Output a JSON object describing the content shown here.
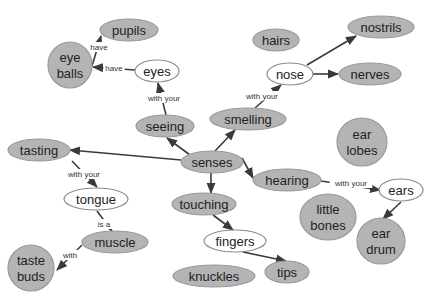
{
  "diagram": {
    "colors": {
      "concept_fill": "#b4b4b4",
      "focus_fill": "#ffffff",
      "edge": "#3a3a3a",
      "background": "#ffffff"
    },
    "nodes": [
      {
        "id": "pupils",
        "lines": [
          "pupils"
        ],
        "x": 129,
        "y": 30,
        "rx": 29,
        "ry": 11,
        "style": "gray"
      },
      {
        "id": "eye_balls",
        "lines": [
          "eye",
          "balls"
        ],
        "x": 70,
        "y": 65,
        "rx": 22,
        "ry": 23,
        "style": "gray"
      },
      {
        "id": "eyes",
        "lines": [
          "eyes"
        ],
        "x": 157,
        "y": 71,
        "rx": 22,
        "ry": 11,
        "style": "white"
      },
      {
        "id": "seeing",
        "lines": [
          "seeing"
        ],
        "x": 165,
        "y": 126,
        "rx": 29,
        "ry": 11,
        "style": "gray"
      },
      {
        "id": "smelling",
        "lines": [
          "smelling"
        ],
        "x": 248,
        "y": 119,
        "rx": 38,
        "ry": 11,
        "style": "gray"
      },
      {
        "id": "hairs",
        "lines": [
          "hairs"
        ],
        "x": 276,
        "y": 40,
        "rx": 23,
        "ry": 11,
        "style": "gray"
      },
      {
        "id": "nostrils",
        "lines": [
          "nostrils"
        ],
        "x": 381,
        "y": 27,
        "rx": 33,
        "ry": 11,
        "style": "gray"
      },
      {
        "id": "nose",
        "lines": [
          "nose"
        ],
        "x": 290,
        "y": 74,
        "rx": 23,
        "ry": 11,
        "style": "white"
      },
      {
        "id": "nerves",
        "lines": [
          "nerves"
        ],
        "x": 370,
        "y": 74,
        "rx": 31,
        "ry": 11,
        "style": "gray"
      },
      {
        "id": "ear_lobes",
        "lines": [
          "ear",
          "lobes"
        ],
        "x": 362,
        "y": 142,
        "rx": 25,
        "ry": 24,
        "style": "gray"
      },
      {
        "id": "tasting",
        "lines": [
          "tasting"
        ],
        "x": 39,
        "y": 150,
        "rx": 31,
        "ry": 11,
        "style": "gray"
      },
      {
        "id": "senses",
        "lines": [
          "senses"
        ],
        "x": 212,
        "y": 162,
        "rx": 31,
        "ry": 11,
        "style": "gray"
      },
      {
        "id": "hearing",
        "lines": [
          "hearing"
        ],
        "x": 287,
        "y": 180,
        "rx": 34,
        "ry": 11,
        "style": "gray"
      },
      {
        "id": "ears",
        "lines": [
          "ears"
        ],
        "x": 401,
        "y": 190,
        "rx": 22,
        "ry": 11,
        "style": "white"
      },
      {
        "id": "tongue",
        "lines": [
          "tongue"
        ],
        "x": 96,
        "y": 199,
        "rx": 32,
        "ry": 11,
        "style": "white"
      },
      {
        "id": "touching",
        "lines": [
          "touching"
        ],
        "x": 204,
        "y": 204,
        "rx": 32,
        "ry": 11,
        "style": "gray"
      },
      {
        "id": "little_bones",
        "lines": [
          "little",
          "bones"
        ],
        "x": 328,
        "y": 217,
        "rx": 28,
        "ry": 23,
        "style": "gray"
      },
      {
        "id": "ear_drum",
        "lines": [
          "ear",
          "drum"
        ],
        "x": 381,
        "y": 241,
        "rx": 24,
        "ry": 23,
        "style": "gray"
      },
      {
        "id": "muscle",
        "lines": [
          "muscle"
        ],
        "x": 115,
        "y": 242,
        "rx": 33,
        "ry": 11,
        "style": "gray"
      },
      {
        "id": "fingers",
        "lines": [
          "fingers"
        ],
        "x": 235,
        "y": 241,
        "rx": 31,
        "ry": 11,
        "style": "white"
      },
      {
        "id": "taste_buds",
        "lines": [
          "taste",
          "buds"
        ],
        "x": 31,
        "y": 268,
        "rx": 23,
        "ry": 23,
        "style": "gray"
      },
      {
        "id": "knuckles",
        "lines": [
          "knuckles"
        ],
        "x": 214,
        "y": 276,
        "rx": 41,
        "ry": 11,
        "style": "gray"
      },
      {
        "id": "tips",
        "lines": [
          "tips"
        ],
        "x": 287,
        "y": 272,
        "rx": 22,
        "ry": 11,
        "style": "gray"
      }
    ],
    "edges": [
      {
        "from": "eye_balls",
        "to": "pupils",
        "label": "have",
        "x1": 92,
        "y1": 66,
        "x2": 101,
        "y2": 36,
        "lx": 99,
        "ly": 47
      },
      {
        "from": "eyes",
        "to": "eye_balls",
        "label": "have",
        "x1": 135,
        "y1": 70,
        "x2": 93,
        "y2": 67,
        "lx": 114,
        "ly": 68
      },
      {
        "from": "seeing",
        "to": "eyes",
        "label": "with your",
        "x1": 166,
        "y1": 115,
        "x2": 158,
        "y2": 83,
        "lx": 164,
        "ly": 98
      },
      {
        "from": "senses",
        "to": "seeing",
        "label": "",
        "x1": 190,
        "y1": 155,
        "x2": 167,
        "y2": 138,
        "lx": 0,
        "ly": 0
      },
      {
        "from": "senses",
        "to": "smelling",
        "label": "",
        "x1": 215,
        "y1": 151,
        "x2": 235,
        "y2": 130,
        "lx": 0,
        "ly": 0
      },
      {
        "from": "smelling",
        "to": "nose",
        "label": "with your",
        "x1": 255,
        "y1": 108,
        "x2": 281,
        "y2": 85,
        "lx": 262,
        "ly": 96
      },
      {
        "from": "nose",
        "to": "nostrils",
        "label": "",
        "x1": 307,
        "y1": 65,
        "x2": 356,
        "y2": 36,
        "lx": 0,
        "ly": 0
      },
      {
        "from": "nose",
        "to": "nerves",
        "label": "",
        "x1": 313,
        "y1": 74,
        "x2": 338,
        "y2": 74,
        "lx": 0,
        "ly": 0
      },
      {
        "from": "senses",
        "to": "tasting",
        "label": "",
        "x1": 181,
        "y1": 160,
        "x2": 70,
        "y2": 150,
        "lx": 0,
        "ly": 0
      },
      {
        "from": "tasting",
        "to": "tongue",
        "label": "with your",
        "x1": 72,
        "y1": 161,
        "x2": 97,
        "y2": 187,
        "lx": 84,
        "ly": 174
      },
      {
        "from": "tongue",
        "to": "muscle",
        "label": "is a",
        "x1": 97,
        "y1": 211,
        "x2": 112,
        "y2": 231,
        "lx": 104,
        "ly": 224
      },
      {
        "from": "muscle",
        "to": "taste_buds",
        "label": "with",
        "x1": 82,
        "y1": 245,
        "x2": 57,
        "y2": 270,
        "lx": 70,
        "ly": 255
      },
      {
        "from": "senses",
        "to": "touching",
        "label": "",
        "x1": 211,
        "y1": 173,
        "x2": 211,
        "y2": 193,
        "lx": 0,
        "ly": 0
      },
      {
        "from": "senses",
        "to": "hearing",
        "label": "",
        "x1": 242,
        "y1": 158,
        "x2": 253,
        "y2": 178,
        "lx": 0,
        "ly": 0
      },
      {
        "from": "hearing",
        "to": "ears",
        "label": "with your",
        "x1": 321,
        "y1": 181,
        "x2": 380,
        "y2": 190,
        "lx": 351,
        "ly": 183
      },
      {
        "from": "ears",
        "to": "ear_drum",
        "label": "",
        "x1": 401,
        "y1": 202,
        "x2": 383,
        "y2": 219,
        "lx": 0,
        "ly": 0
      },
      {
        "from": "touching",
        "to": "fingers",
        "label": "",
        "x1": 213,
        "y1": 215,
        "x2": 233,
        "y2": 230,
        "lx": 0,
        "ly": 0
      },
      {
        "from": "fingers",
        "to": "tips",
        "label": "",
        "x1": 243,
        "y1": 252,
        "x2": 286,
        "y2": 261,
        "lx": 0,
        "ly": 0
      }
    ]
  }
}
